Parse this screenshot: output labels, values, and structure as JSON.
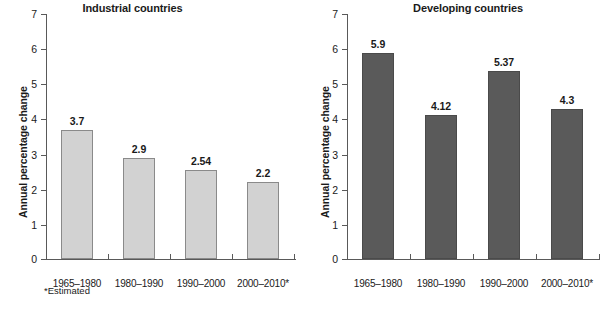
{
  "chart_data": [
    {
      "type": "bar",
      "title": "Industrial countries",
      "xlabel": "",
      "ylabel": "Annual percentage change",
      "categories": [
        "1965–1980",
        "1980–1990",
        "1990–2000",
        "2000–2010*"
      ],
      "values": [
        3.7,
        2.9,
        2.54,
        2.2
      ],
      "value_labels": [
        "3.7",
        "2.9",
        "2.54",
        "2.2"
      ],
      "ylim": [
        0,
        7
      ],
      "yticks": [
        0,
        1,
        2,
        3,
        4,
        5,
        6,
        7
      ],
      "ytick_labels": [
        "0",
        "1",
        "2",
        "3",
        "4",
        "5",
        "6",
        "7"
      ],
      "grid": false,
      "legend": "none",
      "bar_color": "#d2d2d2",
      "bar_border_color": "#8a8a8a",
      "footnote": "*Estimated"
    },
    {
      "type": "bar",
      "title": "Developing countries",
      "xlabel": "",
      "ylabel": "Annual percentage change",
      "categories": [
        "1965–1980",
        "1980–1990",
        "1990–2000",
        "2000–2010*"
      ],
      "values": [
        5.9,
        4.12,
        5.37,
        4.3
      ],
      "value_labels": [
        "5.9",
        "4.12",
        "5.37",
        "4.3"
      ],
      "ylim": [
        0,
        7
      ],
      "yticks": [
        0,
        1,
        2,
        3,
        4,
        5,
        6,
        7
      ],
      "ytick_labels": [
        "0",
        "1",
        "2",
        "3",
        "4",
        "5",
        "6",
        "7"
      ],
      "grid": false,
      "legend": "none",
      "bar_color": "#5a5a5a",
      "bar_border_color": "#4a4a4a",
      "footnote": ""
    }
  ],
  "left": {
    "title": "Industrial countries",
    "ylabel": "Annual percentage change",
    "footnote": "*Estimated",
    "yticks": [
      "7",
      "6",
      "5",
      "4",
      "3",
      "2",
      "1",
      "0"
    ],
    "categories": [
      "1965–1980",
      "1980–1990",
      "1990–2000",
      "2000–2010*"
    ],
    "value_labels": [
      "3.7",
      "2.9",
      "2.54",
      "2.2"
    ]
  },
  "right": {
    "title": "Developing countries",
    "ylabel": "Annual percentage change",
    "yticks": [
      "7",
      "6",
      "5",
      "4",
      "3",
      "2",
      "1",
      "0"
    ],
    "categories": [
      "1965–1980",
      "1980–1990",
      "1990–2000",
      "2000–2010*"
    ],
    "value_labels": [
      "5.9",
      "4.12",
      "5.37",
      "4.3"
    ]
  }
}
